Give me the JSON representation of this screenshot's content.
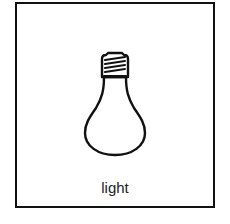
{
  "card": {
    "icon": "light-bulb-icon",
    "label": "light",
    "border_color": "#111111",
    "background": "#ffffff"
  }
}
